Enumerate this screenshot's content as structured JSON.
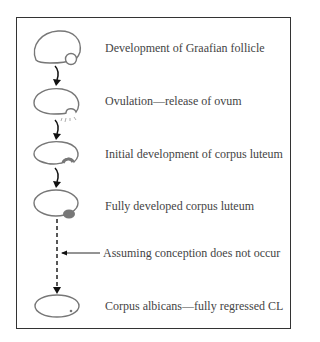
{
  "diagram": {
    "stages": [
      {
        "id": "graafian",
        "label": "Development of Graafian follicle"
      },
      {
        "id": "ovulation",
        "label": "Ovulation—release of ovum"
      },
      {
        "id": "initial-cl",
        "label": "Initial development of corpus luteum"
      },
      {
        "id": "full-cl",
        "label": "Fully developed corpus luteum"
      },
      {
        "id": "albicans",
        "label": "Corpus albicans—fully regressed CL"
      }
    ],
    "condition_label": "Assuming conception does not occur",
    "colors": {
      "outline": "#777777",
      "arrow": "#111111",
      "corpus_luteum": "#777777",
      "frame": "#333333",
      "text": "#444444"
    }
  }
}
